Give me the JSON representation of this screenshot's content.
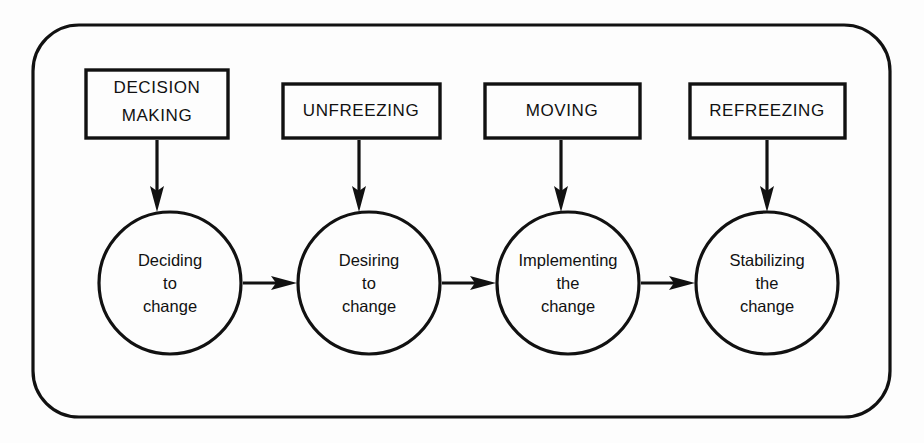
{
  "diagram": {
    "colors": {
      "background": "#fdfdfd",
      "stroke": "#111111",
      "shape_fill": "#fdfdfd"
    },
    "frame": {
      "shape": "rounded-rectangle",
      "x": 33,
      "y": 25,
      "width": 857,
      "height": 392,
      "radius": 46
    },
    "stages": [
      {
        "key": "decision-making",
        "box_label_lines": [
          "DECISION",
          "MAKING"
        ],
        "box_label": "DECISION MAKING",
        "circle_label_lines": [
          "Deciding",
          "to",
          "change"
        ],
        "circle_label": "Deciding to change",
        "box": {
          "x": 86,
          "y": 70,
          "width": 142,
          "height": 68
        },
        "circle": {
          "cx": 170,
          "cy": 283,
          "r": 71
        },
        "down_arrow": {
          "x": 157,
          "y1": 140,
          "y2": 210
        }
      },
      {
        "key": "unfreezing",
        "box_label_lines": [
          "UNFREEZING"
        ],
        "box_label": "UNFREEZING",
        "circle_label_lines": [
          "Desiring",
          "to",
          "change"
        ],
        "circle_label": "Desiring to change",
        "box": {
          "x": 283,
          "y": 84,
          "width": 157,
          "height": 54
        },
        "circle": {
          "cx": 369,
          "cy": 283,
          "r": 71
        },
        "down_arrow": {
          "x": 359,
          "y1": 140,
          "y2": 210
        }
      },
      {
        "key": "moving",
        "box_label_lines": [
          "MOVING"
        ],
        "box_label": "MOVING",
        "circle_label_lines": [
          "Implementing",
          "the",
          "change"
        ],
        "circle_label": "Implementing the change",
        "box": {
          "x": 485,
          "y": 84,
          "width": 155,
          "height": 54
        },
        "circle": {
          "cx": 568,
          "cy": 283,
          "r": 71
        },
        "down_arrow": {
          "x": 561,
          "y1": 140,
          "y2": 210
        }
      },
      {
        "key": "refreezing",
        "box_label_lines": [
          "REFREEZING"
        ],
        "box_label": "REFREEZING",
        "circle_label_lines": [
          "Stabilizing",
          "the",
          "change"
        ],
        "circle_label": "Stabilizing the change",
        "box": {
          "x": 690,
          "y": 84,
          "width": 155,
          "height": 54
        },
        "circle": {
          "cx": 767,
          "cy": 283,
          "r": 71
        },
        "down_arrow": {
          "x": 767,
          "y1": 140,
          "y2": 210
        }
      }
    ],
    "flow_arrows": [
      {
        "from": "decision-making",
        "to": "unfreezing",
        "x1": 243,
        "x2": 295,
        "y": 283
      },
      {
        "from": "unfreezing",
        "to": "moving",
        "x1": 442,
        "x2": 494,
        "y": 283
      },
      {
        "from": "moving",
        "to": "refreezing",
        "x1": 641,
        "x2": 693,
        "y": 283
      }
    ]
  }
}
